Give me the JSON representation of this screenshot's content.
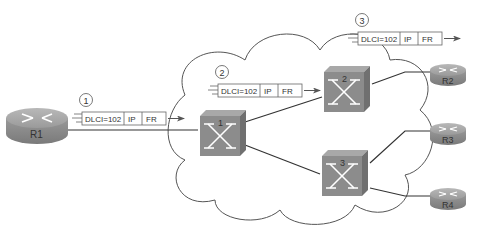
{
  "diagram": {
    "cloud_label": "Frame Relay network",
    "routers": [
      {
        "id": "R1",
        "label": "R1"
      },
      {
        "id": "R2",
        "label": "R2"
      },
      {
        "id": "R3",
        "label": "R3"
      },
      {
        "id": "R4",
        "label": "R4"
      }
    ],
    "switches": [
      {
        "id": "sw1",
        "label": "1"
      },
      {
        "id": "sw2",
        "label": "2"
      },
      {
        "id": "sw3",
        "label": "3"
      }
    ],
    "frames": [
      {
        "step": "1",
        "dlci": "DLCI=102",
        "ip": "IP",
        "fr": "FR"
      },
      {
        "step": "2",
        "dlci": "DLCI=102",
        "ip": "IP",
        "fr": "FR"
      },
      {
        "step": "3",
        "dlci": "DLCI=102",
        "ip": "IP",
        "fr": "FR"
      }
    ],
    "links": [
      {
        "from": "R1",
        "to": "sw1"
      },
      {
        "from": "sw1",
        "to": "sw2"
      },
      {
        "from": "sw1",
        "to": "sw3"
      },
      {
        "from": "sw2",
        "to": "R2"
      },
      {
        "from": "sw3",
        "to": "R3"
      },
      {
        "from": "sw3",
        "to": "R4"
      }
    ],
    "colors": {
      "device_gray": "#8c8c8c",
      "line": "#333333",
      "cloud_stroke": "#555555"
    }
  }
}
